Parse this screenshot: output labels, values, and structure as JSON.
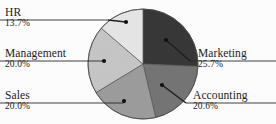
{
  "chart_data": {
    "type": "pie",
    "title": "",
    "subtitle": "",
    "xlabel": "",
    "ylabel": "",
    "legend_position": "callout-labels",
    "grid": false,
    "units": "percent",
    "start_angle_deg": 0,
    "direction": "clockwise",
    "categories": [
      "Marketing",
      "Accounting",
      "Sales",
      "Management",
      "HR"
    ],
    "values": [
      25.7,
      20.6,
      20.0,
      20.0,
      13.7
    ],
    "slices": [
      {
        "label": "Marketing",
        "percent_text": "25.7%",
        "value": 25.7,
        "color": "#383838",
        "start_deg": 0,
        "end_deg": 92.52,
        "label_side": "right",
        "dot_x": 166,
        "dot_y": 40,
        "rule_y": 61,
        "rule_x1": 190,
        "rule_x2": 276
      },
      {
        "label": "Accounting",
        "percent_text": "20.6%",
        "value": 20.6,
        "color": "#757575",
        "start_deg": 92.52,
        "end_deg": 166.68,
        "label_side": "right",
        "dot_x": 162,
        "dot_y": 85,
        "rule_y": 103,
        "rule_x1": 186,
        "rule_x2": 276
      },
      {
        "label": "Sales",
        "percent_text": "20.0%",
        "value": 20.0,
        "color": "#9c9c9c",
        "start_deg": 166.68,
        "end_deg": 238.68,
        "label_side": "left",
        "dot_x": 124,
        "dot_y": 101,
        "rule_y": 103,
        "rule_x1": 0,
        "rule_x2": 124
      },
      {
        "label": "Management",
        "percent_text": "20.0%",
        "value": 20.0,
        "color": "#c6c6c6",
        "start_deg": 238.68,
        "end_deg": 310.68,
        "label_side": "left",
        "dot_x": 104,
        "dot_y": 61,
        "rule_y": 61,
        "rule_x1": 0,
        "rule_x2": 104
      },
      {
        "label": "HR",
        "percent_text": "13.7%",
        "value": 13.7,
        "color": "#e6e6e6",
        "start_deg": 310.68,
        "end_deg": 360,
        "label_side": "left",
        "dot_x": 126,
        "dot_y": 22,
        "rule_y": 20,
        "rule_x1": 0,
        "rule_x2": 108
      }
    ]
  },
  "labels": {
    "hr": {
      "name": "HR",
      "percent": "13.7%"
    },
    "management": {
      "name": "Management",
      "percent": "20.0%"
    },
    "sales": {
      "name": "Sales",
      "percent": "20.0%"
    },
    "marketing": {
      "name": "Marketing",
      "percent": "25.7%"
    },
    "accounting": {
      "name": "Accounting",
      "percent": "20.6%"
    }
  },
  "geometry": {
    "center_x": 143,
    "center_y": 64,
    "radius": 55
  },
  "colors": {
    "background": "#ffffff",
    "text": "#1c1c1c",
    "line": "#2b2b2b",
    "slice_edge": "#555555"
  }
}
